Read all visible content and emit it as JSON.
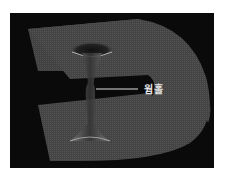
{
  "figure": {
    "label": "웜홀",
    "colors": {
      "background": "#0a0a0a",
      "surface": "#4a4a4a",
      "surface_edge": "#6a6a6a",
      "leader_line": "#e0e0e0",
      "label_text": "#e6e6e6",
      "page": "#ffffff"
    }
  }
}
